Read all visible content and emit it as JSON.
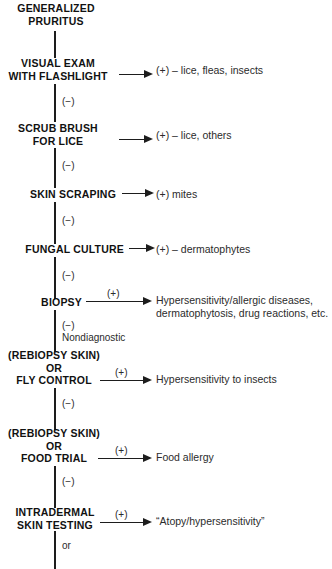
{
  "diagram": {
    "title": "GENERALIZED PRURITUS",
    "type": "clinical-diagnostic-flowchart",
    "root": {
      "lines": [
        "GENERALIZED",
        "PRURITUS"
      ]
    },
    "steps": [
      {
        "id": "visual-exam",
        "lines": [
          "VISUAL EXAM",
          "WITH FLASHLIGHT"
        ],
        "result": "(+) – lice, fleas, insects",
        "branch_label": "(−)",
        "plus_above_arrow": ""
      },
      {
        "id": "scrub-brush",
        "lines": [
          "SCRUB BRUSH",
          "FOR LICE"
        ],
        "result": "(+) – lice, others",
        "branch_label": "(−)",
        "plus_above_arrow": ""
      },
      {
        "id": "skin-scraping",
        "lines": [
          "SKIN SCRAPING"
        ],
        "result": "(+) mites",
        "branch_label": "(−)",
        "plus_above_arrow": ""
      },
      {
        "id": "fungal-culture",
        "lines": [
          "FUNGAL CULTURE"
        ],
        "result": "(+) – dermatophytes",
        "branch_label": "(−)",
        "plus_above_arrow": ""
      },
      {
        "id": "biopsy",
        "lines": [
          "BIOPSY"
        ],
        "result_line1": "Hypersensitivity/allergic diseases,",
        "result_line2": "dermatophytosis, drug reactions, etc.",
        "branch_label": "(−)",
        "branch_sublabel": "Nondiagnostic",
        "plus_above_arrow": "(+)"
      },
      {
        "id": "rebiopsy-fly-control",
        "lines": [
          "(REBIOPSY SKIN)",
          "OR",
          "FLY CONTROL"
        ],
        "result": "Hypersensitivity to insects",
        "branch_label": "(−)",
        "plus_above_arrow": "(+)"
      },
      {
        "id": "rebiopsy-food-trial",
        "lines": [
          "(REBIOPSY SKIN)",
          "OR",
          "FOOD TRIAL"
        ],
        "result": "Food allergy",
        "branch_label": "(−)",
        "plus_above_arrow": "(+)"
      },
      {
        "id": "intradermal-skin-testing",
        "lines": [
          "INTRADERMAL",
          "SKIN TESTING"
        ],
        "result": "“Atopy/hypersensitivity”",
        "branch_label": "or",
        "plus_above_arrow": "(+)"
      }
    ],
    "colors": {
      "ink": "#1d1d1d",
      "text": "#2b2b2b",
      "background": "#ffffff"
    }
  }
}
